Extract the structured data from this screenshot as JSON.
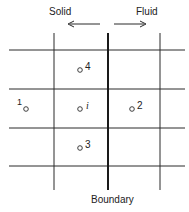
{
  "labels": {
    "solid": "Solid",
    "fluid": "Fluid",
    "boundary": "Boundary"
  },
  "nodes": [
    {
      "id": "4",
      "label": "4"
    },
    {
      "id": "1",
      "label": "1"
    },
    {
      "id": "i",
      "label": "i"
    },
    {
      "id": "2",
      "label": "2"
    },
    {
      "id": "3",
      "label": "3"
    }
  ],
  "colors": {
    "line": "#2a2a2a",
    "text": "#222222"
  }
}
